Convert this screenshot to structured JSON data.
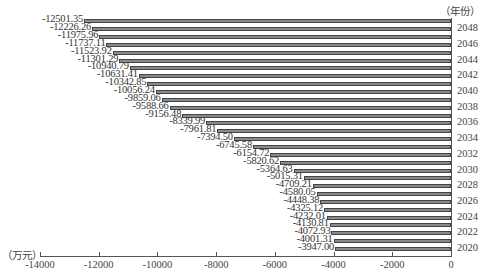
{
  "chart_data": {
    "type": "bar",
    "orientation": "horizontal",
    "title": "",
    "xlabel": "（万元）",
    "ylabel": "（年份）",
    "xlim": [
      -14000,
      0
    ],
    "x_ticks": [
      "-14000",
      "-12000",
      "-10000",
      "-8000",
      "-6000",
      "-4000",
      "-2000",
      "0"
    ],
    "y_tick_labels": [
      "2020",
      "2022",
      "2024",
      "2026",
      "2028",
      "2030",
      "2032",
      "2034",
      "2036",
      "2038",
      "2040",
      "2042",
      "2044",
      "2046",
      "2048"
    ],
    "grid": false,
    "legend": null,
    "categories": [
      "2020",
      "2021",
      "2022",
      "2023",
      "2024",
      "2025",
      "2026",
      "2027",
      "2028",
      "2029",
      "2030",
      "2031",
      "2032",
      "2033",
      "2034",
      "2035",
      "2036",
      "2037",
      "2038",
      "2039",
      "2040",
      "2041",
      "2042",
      "2043",
      "2044",
      "2045",
      "2046",
      "2047",
      "2048",
      "2049"
    ],
    "values": [
      -3947.0,
      -4001.31,
      -4072.93,
      -4130.81,
      -4232.01,
      -4325.12,
      -4448.38,
      -4580.05,
      -4709.21,
      -5015.31,
      -5364.63,
      -5820.62,
      -6154.72,
      -6745.58,
      -7394.5,
      -7961.81,
      -8339.99,
      -9156.48,
      -9588.66,
      -9859.06,
      -10056.24,
      -10342.85,
      -10631.41,
      -10940.79,
      -11301.29,
      -11523.92,
      -11737.11,
      -11975.96,
      -12226.26,
      -12501.35
    ],
    "value_labels": [
      "-3947.00",
      "-4001.31",
      "-4072.93",
      "-4130.81",
      "-4232.01",
      "-4325.12",
      "-4448.38",
      "-4580.05",
      "-4709.21",
      "-5015.31",
      "-5364.63",
      "-5820.62",
      "-6154.72",
      "-6745.58",
      "-7394.50",
      "-7961.81",
      "-8339.99",
      "-9156.48",
      "-9588.66",
      "-9859.06",
      "-10056.24",
      "-10342.85",
      "-10631.41",
      "-10940.79",
      "-11301.29",
      "-11523.92",
      "-11737.11",
      "-11975.96",
      "-12226.26",
      "-12501.35"
    ],
    "colors": {
      "bar_fill": "#8a8a8a",
      "bar_edge": "#444444",
      "axis": "#555555",
      "text": "#333333"
    }
  }
}
